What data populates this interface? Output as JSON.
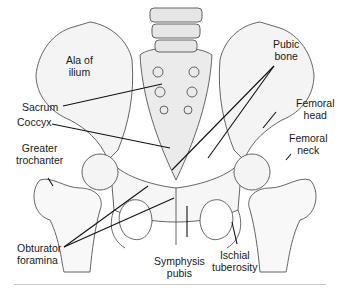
{
  "figure": {
    "type": "anatomical-diagram",
    "labels": {
      "ala_of_ilium": [
        "Ala of",
        "ilium"
      ],
      "pubic_bone": [
        "Pubic",
        "bone"
      ],
      "sacrum": "Sacrum",
      "coccyx": "Coccyx",
      "femoral_head": [
        "Femoral",
        "head"
      ],
      "femoral_neck": [
        "Femoral",
        "neck"
      ],
      "greater_trochanter": [
        "Greater",
        "trochanter"
      ],
      "obturator_foramina": [
        "Obturator",
        "foramina"
      ],
      "symphysis_pubis": [
        "Symphysis",
        "pubis"
      ],
      "ischial_tuberosity": [
        "Ischial",
        "tuberosity"
      ]
    }
  }
}
